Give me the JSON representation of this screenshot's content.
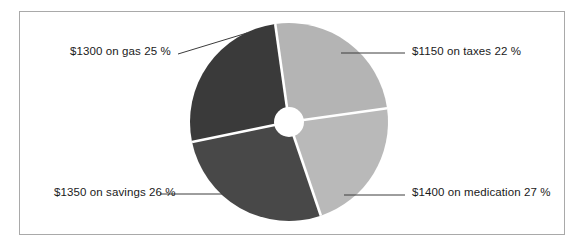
{
  "figure": {
    "background_color": "#ffffff",
    "frame_color": "#a9a9a9"
  },
  "chart_data": {
    "type": "pie",
    "variant": "donut",
    "title": "",
    "xlabel": "",
    "ylabel": "",
    "legend": "none",
    "labels_position": "outside-with-leader-lines",
    "center": {
      "x": 289,
      "y": 122
    },
    "outer_radius": 99,
    "inner_radius": 15,
    "start_angle_deg": 82,
    "direction": "clockwise",
    "categories": [
      "taxes",
      "medication",
      "savings",
      "gas"
    ],
    "values": [
      1150,
      1400,
      1350,
      1300
    ],
    "percentages": [
      22,
      27,
      26,
      25
    ],
    "total": 5200,
    "currency_symbol": "$",
    "slices": [
      {
        "category": "taxes",
        "amount": 1150,
        "percent": 22,
        "label": "$1150 on taxes 22 %",
        "color": "#b9b9b9",
        "start_angle_deg": 82,
        "end_angle_deg": 161.2
      },
      {
        "category": "medication",
        "amount": 1400,
        "percent": 27,
        "label": "$1400 on medication 27 %",
        "color": "#484848",
        "start_angle_deg": 161.2,
        "end_angle_deg": 258.4
      },
      {
        "category": "savings",
        "amount": 1350,
        "percent": 26,
        "label": "$1350 on savings 26 %",
        "color": "#3a3a3a",
        "start_angle_deg": 258.4,
        "end_angle_deg": 352
      },
      {
        "category": "gas",
        "amount": 1300,
        "percent": 25,
        "label": "$1300 on gas 25 %",
        "color": "#b4b4b4",
        "start_angle_deg": 352,
        "end_angle_deg": 442
      }
    ],
    "separator_color": "#ffffff",
    "leader_line_color": "#3c3c3c"
  }
}
